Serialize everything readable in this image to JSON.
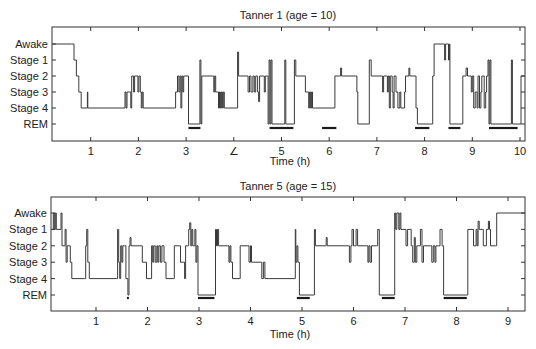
{
  "chart_data": [
    {
      "type": "line",
      "subtype": "hypnogram (step line)",
      "title": "Tanner 1 (age = 10)",
      "xlabel": "Time (h)",
      "ylabel": "",
      "xlim": [
        0.2,
        10.1
      ],
      "x_ticks": [
        1,
        2,
        3,
        4,
        5,
        6,
        7,
        8,
        9,
        10
      ],
      "x_tick_labels": [
        "1",
        "2",
        "3",
        "∠",
        "5",
        "6",
        "7",
        "8",
        "9",
        "10"
      ],
      "y_tick_labels": [
        "Awake",
        "Stage 1",
        "Stage 2",
        "Stage 3",
        "Stage 4",
        "REM"
      ],
      "y_level_index": {
        "Awake": 0,
        "Stage 1": 1,
        "Stage 2": 2,
        "Stage 3": 3,
        "Stage 4": 4,
        "REM": 5
      },
      "grid": false,
      "legend": null,
      "rem_periods_h": [
        [
          3.05,
          3.3
        ],
        [
          4.75,
          5.25
        ],
        [
          5.85,
          6.15
        ],
        [
          7.8,
          8.1
        ],
        [
          8.5,
          8.75
        ],
        [
          9.35,
          9.95
        ]
      ],
      "steps": [
        [
          0.2,
          0
        ],
        [
          0.6,
          0
        ],
        [
          0.65,
          1
        ],
        [
          0.7,
          2
        ],
        [
          0.75,
          3
        ],
        [
          0.8,
          4
        ],
        [
          0.92,
          4
        ],
        [
          0.93,
          3
        ],
        [
          0.94,
          4
        ],
        [
          1.7,
          4
        ],
        [
          1.72,
          3
        ],
        [
          1.74,
          4
        ],
        [
          1.76,
          3
        ],
        [
          1.82,
          3
        ],
        [
          1.84,
          4
        ],
        [
          1.86,
          2
        ],
        [
          1.9,
          3
        ],
        [
          1.92,
          2
        ],
        [
          1.97,
          2
        ],
        [
          1.99,
          3
        ],
        [
          2.01,
          2
        ],
        [
          2.04,
          3
        ],
        [
          2.06,
          4
        ],
        [
          2.08,
          3
        ],
        [
          2.1,
          4
        ],
        [
          2.75,
          4
        ],
        [
          2.78,
          3
        ],
        [
          2.82,
          2
        ],
        [
          2.85,
          3
        ],
        [
          2.87,
          2
        ],
        [
          2.89,
          4
        ],
        [
          2.91,
          2
        ],
        [
          2.93,
          3
        ],
        [
          2.95,
          2
        ],
        [
          3.02,
          2
        ],
        [
          3.05,
          5
        ],
        [
          3.27,
          5
        ],
        [
          3.29,
          1
        ],
        [
          3.31,
          5
        ],
        [
          3.33,
          2
        ],
        [
          3.55,
          2
        ],
        [
          3.58,
          3
        ],
        [
          3.6,
          2
        ],
        [
          3.62,
          3
        ],
        [
          3.66,
          3
        ],
        [
          3.68,
          4
        ],
        [
          3.7,
          3
        ],
        [
          3.72,
          4
        ],
        [
          3.74,
          3
        ],
        [
          3.76,
          4
        ],
        [
          3.78,
          3
        ],
        [
          3.8,
          4
        ],
        [
          4.05,
          4
        ],
        [
          4.08,
          0.5
        ],
        [
          4.1,
          2
        ],
        [
          4.28,
          2
        ],
        [
          4.3,
          3
        ],
        [
          4.33,
          2
        ],
        [
          4.36,
          3
        ],
        [
          4.4,
          2
        ],
        [
          4.43,
          3
        ],
        [
          4.46,
          2
        ],
        [
          4.5,
          3
        ],
        [
          4.52,
          3.6
        ],
        [
          4.54,
          2
        ],
        [
          4.62,
          2
        ],
        [
          4.64,
          3
        ],
        [
          4.66,
          2
        ],
        [
          4.7,
          2
        ],
        [
          4.72,
          5
        ],
        [
          4.74,
          1
        ],
        [
          4.76,
          5
        ],
        [
          4.78,
          1
        ],
        [
          4.8,
          5
        ],
        [
          5.05,
          5
        ],
        [
          5.07,
          1
        ],
        [
          5.09,
          5
        ],
        [
          5.25,
          5
        ],
        [
          5.27,
          1
        ],
        [
          5.3,
          2
        ],
        [
          5.45,
          2
        ],
        [
          5.5,
          3
        ],
        [
          5.55,
          3
        ],
        [
          5.57,
          4
        ],
        [
          5.59,
          3
        ],
        [
          5.61,
          4
        ],
        [
          5.63,
          3
        ],
        [
          5.65,
          4
        ],
        [
          5.7,
          4
        ],
        [
          5.72,
          4
        ],
        [
          6.1,
          4
        ],
        [
          6.12,
          2
        ],
        [
          6.22,
          2
        ],
        [
          6.24,
          1.5
        ],
        [
          6.26,
          2
        ],
        [
          6.55,
          2
        ],
        [
          6.58,
          3
        ],
        [
          6.6,
          5
        ],
        [
          6.82,
          5
        ],
        [
          6.84,
          1
        ],
        [
          6.88,
          2
        ],
        [
          7.1,
          2
        ],
        [
          7.12,
          3
        ],
        [
          7.14,
          2
        ],
        [
          7.2,
          2
        ],
        [
          7.22,
          3
        ],
        [
          7.24,
          2
        ],
        [
          7.26,
          4
        ],
        [
          7.28,
          2
        ],
        [
          7.32,
          3
        ],
        [
          7.34,
          4
        ],
        [
          7.36,
          2
        ],
        [
          7.4,
          3
        ],
        [
          7.44,
          4
        ],
        [
          7.48,
          3
        ],
        [
          7.5,
          4
        ],
        [
          7.55,
          4
        ],
        [
          7.58,
          3
        ],
        [
          7.6,
          2
        ],
        [
          7.65,
          2
        ],
        [
          7.67,
          1.5
        ],
        [
          7.69,
          2
        ],
        [
          7.8,
          2
        ],
        [
          7.82,
          4
        ],
        [
          7.85,
          5
        ],
        [
          8.15,
          5
        ],
        [
          8.17,
          2
        ],
        [
          8.2,
          0
        ],
        [
          8.4,
          0
        ],
        [
          8.42,
          1
        ],
        [
          8.44,
          0
        ],
        [
          8.48,
          0
        ],
        [
          8.5,
          1
        ],
        [
          8.52,
          0
        ],
        [
          8.53,
          5
        ],
        [
          8.78,
          5
        ],
        [
          8.8,
          2
        ],
        [
          8.85,
          2
        ],
        [
          8.87,
          1.5
        ],
        [
          8.9,
          2
        ],
        [
          8.95,
          2
        ],
        [
          8.98,
          3
        ],
        [
          9.0,
          2
        ],
        [
          9.03,
          4
        ],
        [
          9.06,
          3
        ],
        [
          9.1,
          4
        ],
        [
          9.12,
          2
        ],
        [
          9.15,
          4
        ],
        [
          9.18,
          3
        ],
        [
          9.2,
          2
        ],
        [
          9.25,
          4
        ],
        [
          9.28,
          3
        ],
        [
          9.3,
          2
        ],
        [
          9.33,
          1
        ],
        [
          9.35,
          5
        ],
        [
          9.37,
          1
        ],
        [
          9.39,
          5
        ],
        [
          9.8,
          5
        ],
        [
          9.82,
          1
        ],
        [
          9.84,
          5
        ],
        [
          10.0,
          5
        ],
        [
          10.02,
          2
        ]
      ]
    },
    {
      "type": "line",
      "subtype": "hypnogram (step line)",
      "title": "Tanner 5 (age = 15)",
      "xlabel": "Time (h)",
      "ylabel": "",
      "xlim": [
        0.15,
        9.4
      ],
      "x_ticks": [
        1,
        2,
        3,
        4,
        5,
        6,
        7,
        8,
        9
      ],
      "x_tick_labels": [
        "1",
        "2",
        "3",
        "4",
        "5",
        "6",
        "7",
        "8",
        "9"
      ],
      "y_tick_labels": [
        "Awake",
        "Stage 1",
        "Stage 2",
        "Stage 3",
        "Stage 4",
        "REM"
      ],
      "y_level_index": {
        "Awake": 0,
        "Stage 1": 1,
        "Stage 2": 2,
        "Stage 3": 3,
        "Stage 4": 4,
        "REM": 5
      },
      "grid": false,
      "legend": null,
      "rem_periods_h": [
        [
          1.6,
          1.63
        ],
        [
          2.98,
          3.3
        ],
        [
          4.9,
          5.15
        ],
        [
          6.55,
          6.8
        ],
        [
          7.75,
          8.2
        ]
      ],
      "steps": [
        [
          0.15,
          1
        ],
        [
          0.17,
          0
        ],
        [
          0.19,
          1
        ],
        [
          0.21,
          0
        ],
        [
          0.23,
          1
        ],
        [
          0.3,
          1
        ],
        [
          0.32,
          0
        ],
        [
          0.34,
          2
        ],
        [
          0.38,
          2
        ],
        [
          0.4,
          1
        ],
        [
          0.42,
          3
        ],
        [
          0.44,
          2
        ],
        [
          0.48,
          2
        ],
        [
          0.5,
          3
        ],
        [
          0.53,
          4
        ],
        [
          0.78,
          4
        ],
        [
          0.8,
          2
        ],
        [
          0.82,
          1
        ],
        [
          0.84,
          3
        ],
        [
          0.87,
          4
        ],
        [
          1.4,
          4
        ],
        [
          1.42,
          1
        ],
        [
          1.44,
          3
        ],
        [
          1.46,
          4
        ],
        [
          1.48,
          2
        ],
        [
          1.5,
          3
        ],
        [
          1.52,
          2
        ],
        [
          1.55,
          2
        ],
        [
          1.58,
          4
        ],
        [
          1.62,
          5
        ],
        [
          1.64,
          2
        ],
        [
          1.66,
          1.5
        ],
        [
          1.68,
          2
        ],
        [
          1.88,
          2
        ],
        [
          1.9,
          3
        ],
        [
          1.95,
          3
        ],
        [
          1.98,
          4
        ],
        [
          2.05,
          4
        ],
        [
          2.08,
          2
        ],
        [
          2.1,
          3
        ],
        [
          2.12,
          2
        ],
        [
          2.15,
          3
        ],
        [
          2.18,
          2
        ],
        [
          2.2,
          3
        ],
        [
          2.22,
          2
        ],
        [
          2.25,
          3
        ],
        [
          2.28,
          2
        ],
        [
          2.32,
          3
        ],
        [
          2.36,
          4
        ],
        [
          2.5,
          4
        ],
        [
          2.52,
          2
        ],
        [
          2.62,
          2
        ],
        [
          2.64,
          3
        ],
        [
          2.7,
          3
        ],
        [
          2.72,
          4
        ],
        [
          2.74,
          2
        ],
        [
          2.78,
          2
        ],
        [
          2.8,
          1
        ],
        [
          2.82,
          0.6
        ],
        [
          2.84,
          2
        ],
        [
          2.86,
          1
        ],
        [
          2.88,
          2
        ],
        [
          2.92,
          1
        ],
        [
          2.94,
          3
        ],
        [
          2.96,
          2
        ],
        [
          2.98,
          5
        ],
        [
          3.3,
          5
        ],
        [
          3.32,
          1
        ],
        [
          3.34,
          2
        ],
        [
          3.36,
          1
        ],
        [
          3.38,
          2
        ],
        [
          3.55,
          2
        ],
        [
          3.58,
          3
        ],
        [
          3.6,
          2
        ],
        [
          3.62,
          3
        ],
        [
          3.65,
          4
        ],
        [
          3.78,
          4
        ],
        [
          3.8,
          2
        ],
        [
          3.95,
          2
        ],
        [
          3.97,
          3
        ],
        [
          4.0,
          2
        ],
        [
          4.02,
          3
        ],
        [
          4.05,
          3
        ],
        [
          4.2,
          3
        ],
        [
          4.22,
          4
        ],
        [
          4.25,
          3
        ],
        [
          4.28,
          4
        ],
        [
          4.85,
          4
        ],
        [
          4.87,
          1
        ],
        [
          4.88,
          3
        ],
        [
          4.9,
          2
        ],
        [
          4.92,
          3
        ],
        [
          4.95,
          5
        ],
        [
          5.22,
          5
        ],
        [
          5.24,
          1
        ],
        [
          5.26,
          2
        ],
        [
          5.45,
          2
        ],
        [
          5.47,
          1.5
        ],
        [
          5.49,
          2
        ],
        [
          5.9,
          2
        ],
        [
          5.92,
          3
        ],
        [
          5.95,
          2
        ],
        [
          5.97,
          1
        ],
        [
          6.0,
          2
        ],
        [
          6.05,
          1
        ],
        [
          6.08,
          2
        ],
        [
          6.25,
          2
        ],
        [
          6.28,
          3
        ],
        [
          6.3,
          2
        ],
        [
          6.32,
          3
        ],
        [
          6.35,
          2
        ],
        [
          6.45,
          2
        ],
        [
          6.47,
          1
        ],
        [
          6.5,
          5
        ],
        [
          6.78,
          5
        ],
        [
          6.8,
          0
        ],
        [
          6.82,
          1
        ],
        [
          6.84,
          0
        ],
        [
          6.88,
          1
        ],
        [
          6.9,
          0
        ],
        [
          6.92,
          1
        ],
        [
          7.0,
          1
        ],
        [
          7.02,
          2
        ],
        [
          7.05,
          1
        ],
        [
          7.1,
          1
        ],
        [
          7.12,
          2
        ],
        [
          7.15,
          3
        ],
        [
          7.18,
          1.5
        ],
        [
          7.2,
          3
        ],
        [
          7.23,
          2
        ],
        [
          7.28,
          2
        ],
        [
          7.3,
          1
        ],
        [
          7.33,
          3
        ],
        [
          7.36,
          2
        ],
        [
          7.5,
          2
        ],
        [
          7.52,
          3
        ],
        [
          7.55,
          2
        ],
        [
          7.58,
          3
        ],
        [
          7.6,
          2
        ],
        [
          7.65,
          2
        ],
        [
          7.68,
          1
        ],
        [
          7.72,
          2
        ],
        [
          7.75,
          5
        ],
        [
          8.2,
          5
        ],
        [
          8.22,
          1
        ],
        [
          8.3,
          1
        ],
        [
          8.33,
          2
        ],
        [
          8.38,
          1
        ],
        [
          8.4,
          2
        ],
        [
          8.42,
          0.5
        ],
        [
          8.44,
          1
        ],
        [
          8.5,
          1
        ],
        [
          8.52,
          2
        ],
        [
          8.58,
          1
        ],
        [
          8.62,
          0.5
        ],
        [
          8.64,
          1
        ],
        [
          8.66,
          2
        ],
        [
          8.76,
          2
        ],
        [
          8.78,
          0
        ],
        [
          9.4,
          0
        ]
      ]
    }
  ],
  "panels": [
    {
      "title": "Tanner 1 (age = 10)",
      "xlabel": "Time (h)"
    },
    {
      "title": "Tanner 5 (age = 15)",
      "xlabel": "Time (h)"
    }
  ],
  "colors": {
    "line": "#3a3a3a",
    "rem_bar": "#1a1a1a",
    "axis": "#333333",
    "text": "#222222"
  }
}
